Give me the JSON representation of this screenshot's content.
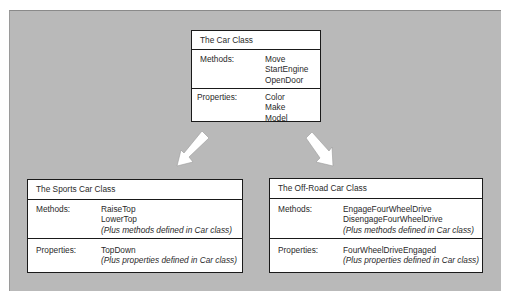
{
  "diagram": {
    "background_color": "#b9b9b9",
    "base_class": {
      "title": "The Car Class",
      "methods_label": "Methods:",
      "methods": [
        "Move",
        "StartEngine",
        "OpenDoor"
      ],
      "properties_label": "Properties:",
      "properties": [
        "Color",
        "Make",
        "Model"
      ]
    },
    "derived_classes": [
      {
        "title": "The Sports Car Class",
        "methods_label": "Methods:",
        "methods": [
          "RaiseTop",
          "LowerTop"
        ],
        "methods_note": "(Plus methods defined in Car class)",
        "properties_label": "Properties:",
        "properties": [
          "TopDown"
        ],
        "properties_note": "(Plus properties defined in Car class)"
      },
      {
        "title": "The Off-Road Car Class",
        "methods_label": "Methods:",
        "methods": [
          "EngageFourWheelDrive",
          "DisengageFourWheelDrive"
        ],
        "methods_note": "(Plus methods defined in Car class)",
        "properties_label": "Properties:",
        "properties": [
          "FourWheelDriveEngaged"
        ],
        "properties_note": "(Plus properties defined in Car class)"
      }
    ],
    "arrows": [
      {
        "name": "inherit-arrow-sports",
        "direction": "down-left"
      },
      {
        "name": "inherit-arrow-offroad",
        "direction": "down-right"
      }
    ]
  }
}
